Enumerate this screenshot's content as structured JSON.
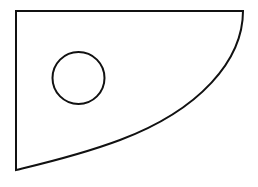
{
  "diagram": {
    "type": "geometric-shape",
    "stroke_color": "#111111",
    "fill_color": "#ffffff",
    "stroke_width": 2,
    "outer_shape": {
      "top_left": [
        16,
        11
      ],
      "top_right": [
        243,
        11
      ],
      "bottom_left": [
        16,
        170
      ],
      "curve_path": "M243,11 C243,60 200,110 120,140 C80,155 45,163 16,170"
    },
    "hole": {
      "shape": "circle",
      "cx": 78.5,
      "cy": 78,
      "r": 26
    }
  }
}
